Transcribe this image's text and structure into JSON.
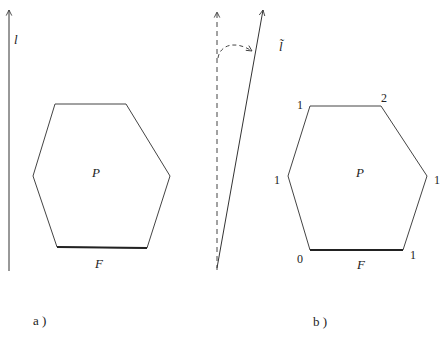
{
  "panel_a": {
    "caption": "a )",
    "axis_label": "l",
    "polygon_label": "P",
    "face_label": "F"
  },
  "panel_b": {
    "caption": "b )",
    "axis_label": "l̃",
    "polygon_label": "P",
    "face_label": "F",
    "vertex_labels": {
      "top_left": "1",
      "top_right": "2",
      "mid_left": "1",
      "mid_right": "1",
      "bottom_left": "0",
      "bottom_right": "1"
    }
  },
  "colors": {
    "line": "#333333",
    "text": "#222222",
    "background": "#ffffff"
  }
}
